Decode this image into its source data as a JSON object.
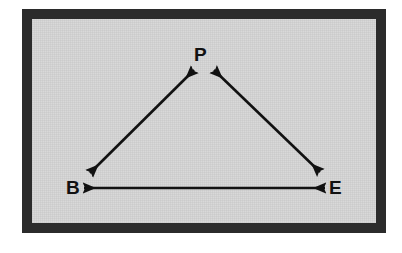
{
  "figure": {
    "caption": "",
    "frame": {
      "border_color": "#2b2b2b",
      "plate_color": "#d9d9d9",
      "page_color": "#ffffff",
      "border_width_px": 10
    },
    "ink_color": "#111111"
  },
  "diagram": {
    "type": "triangle-relationship",
    "nodes": [
      {
        "id": "P",
        "label": "P",
        "x": 203,
        "y": 55,
        "name": "node-p"
      },
      {
        "id": "B",
        "label": "B",
        "x": 74,
        "y": 188,
        "name": "node-b"
      },
      {
        "id": "E",
        "label": "E",
        "x": 334,
        "y": 188,
        "name": "node-e"
      }
    ],
    "edges": [
      {
        "id": "B-P",
        "from": "B",
        "to": "P",
        "bidirectional": true,
        "x1": 90,
        "y1": 173,
        "x2": 194,
        "y2": 70,
        "name": "arrow-b-p"
      },
      {
        "id": "P-E",
        "from": "P",
        "to": "E",
        "bidirectional": true,
        "x1": 214,
        "y1": 70,
        "x2": 320,
        "y2": 172,
        "name": "arrow-p-e"
      },
      {
        "id": "B-E",
        "from": "B",
        "to": "E",
        "bidirectional": true,
        "x1": 84,
        "y1": 188,
        "x2": 325,
        "y2": 188,
        "name": "arrow-b-e"
      }
    ],
    "line_width_px": 2.6,
    "arrowhead_style": "solid-filled-triangle"
  }
}
